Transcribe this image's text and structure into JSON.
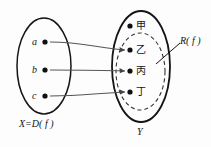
{
  "figure": {
    "colors": {
      "ink": "#141414",
      "arrow": "#555555",
      "dashed": "#333333",
      "background": "#fdfdfd"
    }
  },
  "domain_set": {
    "label": "X=D( f )",
    "elements": [
      {
        "name": "a",
        "label": "a"
      },
      {
        "name": "b",
        "label": "b"
      },
      {
        "name": "c",
        "label": "c"
      }
    ]
  },
  "codomain_set": {
    "label": "Y",
    "elements": [
      {
        "name": "jia",
        "label": "甲"
      },
      {
        "name": "yi",
        "label": "乙"
      },
      {
        "name": "bing",
        "label": "丙"
      },
      {
        "name": "ding",
        "label": "丁"
      }
    ]
  },
  "range_region": {
    "label": "R( f )",
    "contains": [
      "乙",
      "丙",
      "丁"
    ]
  },
  "mappings": [
    {
      "from": "a",
      "to": "乙"
    },
    {
      "from": "b",
      "to": "丙"
    },
    {
      "from": "c",
      "to": "丁"
    }
  ]
}
